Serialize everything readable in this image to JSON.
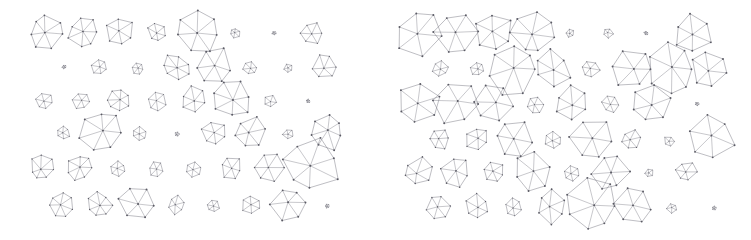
{
  "figure": {
    "width": 751,
    "height": 240,
    "background": "#ffffff",
    "stroke_color": "#6e6e78",
    "node_color": "#5a5a64",
    "glyph_type": "wheel-graph"
  },
  "chart_data": {
    "type": "scatter",
    "title": "",
    "subtitle": "",
    "xlabel": "",
    "ylabel": "",
    "grid": false,
    "legend": null,
    "axis_ticks": [],
    "marker": "wheel-graph",
    "xlim": [
      0,
      751
    ],
    "ylim": [
      0,
      240
    ],
    "panels": [
      {
        "name": "left-panel",
        "x_range": [
          20,
          345
        ],
        "y_range": [
          10,
          230
        ],
        "points": [
          {
            "x": 46,
            "y": 32,
            "size": 16,
            "sides": 7,
            "rot": 14
          },
          {
            "x": 84,
            "y": 32,
            "size": 15,
            "sides": 7,
            "rot": 52
          },
          {
            "x": 120,
            "y": 32,
            "size": 14,
            "sides": 6,
            "rot": 23
          },
          {
            "x": 157,
            "y": 32,
            "size": 10,
            "sides": 6,
            "rot": 77
          },
          {
            "x": 198,
            "y": 31,
            "size": 21,
            "sides": 7,
            "rot": 9
          },
          {
            "x": 235,
            "y": 33,
            "size": 5,
            "sides": 6,
            "rot": 40
          },
          {
            "x": 274,
            "y": 33,
            "size": 2,
            "sides": 5,
            "rot": 15
          },
          {
            "x": 312,
            "y": 33,
            "size": 11,
            "sides": 6,
            "rot": 63
          },
          {
            "x": 64,
            "y": 67,
            "size": 2,
            "sides": 5,
            "rot": 30
          },
          {
            "x": 100,
            "y": 67,
            "size": 8,
            "sides": 6,
            "rot": 18
          },
          {
            "x": 138,
            "y": 68,
            "size": 6,
            "sides": 6,
            "rot": 70
          },
          {
            "x": 176,
            "y": 67,
            "size": 13,
            "sides": 7,
            "rot": 34
          },
          {
            "x": 214,
            "y": 67,
            "size": 19,
            "sides": 6,
            "rot": 5
          },
          {
            "x": 250,
            "y": 68,
            "size": 7,
            "sides": 6,
            "rot": 48
          },
          {
            "x": 288,
            "y": 68,
            "size": 4,
            "sides": 5,
            "rot": 27
          },
          {
            "x": 325,
            "y": 67,
            "size": 12,
            "sides": 6,
            "rot": 59
          },
          {
            "x": 44,
            "y": 101,
            "size": 8,
            "sides": 6,
            "rot": 12
          },
          {
            "x": 81,
            "y": 101,
            "size": 8,
            "sides": 6,
            "rot": 66
          },
          {
            "x": 119,
            "y": 100,
            "size": 11,
            "sides": 7,
            "rot": 31
          },
          {
            "x": 157,
            "y": 101,
            "size": 9,
            "sides": 6,
            "rot": 80
          },
          {
            "x": 194,
            "y": 100,
            "size": 13,
            "sides": 6,
            "rot": 20
          },
          {
            "x": 232,
            "y": 99,
            "size": 18,
            "sides": 7,
            "rot": 44
          },
          {
            "x": 270,
            "y": 101,
            "size": 7,
            "sides": 5,
            "rot": 8
          },
          {
            "x": 308,
            "y": 101,
            "size": 2,
            "sides": 5,
            "rot": 55
          },
          {
            "x": 63,
            "y": 133,
            "size": 7,
            "sides": 6,
            "rot": 25
          },
          {
            "x": 101,
            "y": 132,
            "size": 20,
            "sides": 7,
            "rot": 61
          },
          {
            "x": 139,
            "y": 134,
            "size": 7,
            "sides": 6,
            "rot": 37
          },
          {
            "x": 177,
            "y": 134,
            "size": 2,
            "sides": 5,
            "rot": 72
          },
          {
            "x": 214,
            "y": 133,
            "size": 12,
            "sides": 6,
            "rot": 16
          },
          {
            "x": 250,
            "y": 133,
            "size": 16,
            "sides": 6,
            "rot": 50
          },
          {
            "x": 288,
            "y": 134,
            "size": 5,
            "sides": 5,
            "rot": 29
          },
          {
            "x": 326,
            "y": 132,
            "size": 18,
            "sides": 7,
            "rot": 68
          },
          {
            "x": 42,
            "y": 168,
            "size": 12,
            "sides": 7,
            "rot": 10
          },
          {
            "x": 80,
            "y": 168,
            "size": 12,
            "sides": 7,
            "rot": 57
          },
          {
            "x": 118,
            "y": 169,
            "size": 8,
            "sides": 6,
            "rot": 22
          },
          {
            "x": 156,
            "y": 169,
            "size": 7,
            "sides": 6,
            "rot": 75
          },
          {
            "x": 193,
            "y": 169,
            "size": 8,
            "sides": 6,
            "rot": 41
          },
          {
            "x": 231,
            "y": 168,
            "size": 11,
            "sides": 6,
            "rot": 13
          },
          {
            "x": 269,
            "y": 168,
            "size": 14,
            "sides": 6,
            "rot": 64
          },
          {
            "x": 311,
            "y": 166,
            "size": 27,
            "sides": 7,
            "rot": 35
          },
          {
            "x": 61,
            "y": 205,
            "size": 12,
            "sides": 7,
            "rot": 19
          },
          {
            "x": 99,
            "y": 205,
            "size": 12,
            "sides": 7,
            "rot": 53
          },
          {
            "x": 138,
            "y": 204,
            "size": 18,
            "sides": 6,
            "rot": 7
          },
          {
            "x": 176,
            "y": 205,
            "size": 9,
            "sides": 6,
            "rot": 46
          },
          {
            "x": 213,
            "y": 206,
            "size": 6,
            "sides": 6,
            "rot": 78
          },
          {
            "x": 251,
            "y": 205,
            "size": 9,
            "sides": 6,
            "rot": 26
          },
          {
            "x": 289,
            "y": 204,
            "size": 17,
            "sides": 6,
            "rot": 60
          },
          {
            "x": 327,
            "y": 206,
            "size": 2,
            "sides": 5,
            "rot": 33
          }
        ]
      },
      {
        "name": "right-panel",
        "x_range": [
          395,
          745
        ],
        "y_range": [
          10,
          230
        ],
        "points": [
          {
            "x": 419,
            "y": 33,
            "size": 22,
            "sides": 6,
            "rot": 15
          },
          {
            "x": 457,
            "y": 33,
            "size": 21,
            "sides": 6,
            "rot": 58
          },
          {
            "x": 494,
            "y": 33,
            "size": 19,
            "sides": 6,
            "rot": 24
          },
          {
            "x": 533,
            "y": 32,
            "size": 23,
            "sides": 7,
            "rot": 69
          },
          {
            "x": 570,
            "y": 33,
            "size": 4,
            "sides": 5,
            "rot": 38
          },
          {
            "x": 608,
            "y": 33,
            "size": 5,
            "sides": 5,
            "rot": 11
          },
          {
            "x": 646,
            "y": 33,
            "size": 2,
            "sides": 5,
            "rot": 50
          },
          {
            "x": 693,
            "y": 33,
            "size": 19,
            "sides": 6,
            "rot": 28
          },
          {
            "x": 440,
            "y": 69,
            "size": 8,
            "sides": 6,
            "rot": 43
          },
          {
            "x": 478,
            "y": 69,
            "size": 7,
            "sides": 6,
            "rot": 17
          },
          {
            "x": 513,
            "y": 68,
            "size": 26,
            "sides": 7,
            "rot": 62
          },
          {
            "x": 552,
            "y": 69,
            "size": 18,
            "sides": 6,
            "rot": 31
          },
          {
            "x": 590,
            "y": 69,
            "size": 9,
            "sides": 6,
            "rot": 74
          },
          {
            "x": 632,
            "y": 68,
            "size": 21,
            "sides": 6,
            "rot": 6
          },
          {
            "x": 672,
            "y": 68,
            "size": 24,
            "sides": 7,
            "rot": 47
          },
          {
            "x": 710,
            "y": 69,
            "size": 18,
            "sides": 6,
            "rot": 21
          },
          {
            "x": 418,
            "y": 103,
            "size": 20,
            "sides": 6,
            "rot": 36
          },
          {
            "x": 456,
            "y": 103,
            "size": 21,
            "sides": 6,
            "rot": 65
          },
          {
            "x": 494,
            "y": 103,
            "size": 19,
            "sides": 6,
            "rot": 9
          },
          {
            "x": 535,
            "y": 105,
            "size": 8,
            "sides": 6,
            "rot": 54
          },
          {
            "x": 572,
            "y": 104,
            "size": 17,
            "sides": 6,
            "rot": 27
          },
          {
            "x": 610,
            "y": 104,
            "size": 8,
            "sides": 6,
            "rot": 71
          },
          {
            "x": 650,
            "y": 103,
            "size": 21,
            "sides": 6,
            "rot": 42
          },
          {
            "x": 697,
            "y": 104,
            "size": 2,
            "sides": 5,
            "rot": 14
          },
          {
            "x": 439,
            "y": 139,
            "size": 11,
            "sides": 6,
            "rot": 56
          },
          {
            "x": 477,
            "y": 139,
            "size": 11,
            "sides": 6,
            "rot": 23
          },
          {
            "x": 513,
            "y": 139,
            "size": 19,
            "sides": 6,
            "rot": 67
          },
          {
            "x": 553,
            "y": 140,
            "size": 8,
            "sides": 6,
            "rot": 32
          },
          {
            "x": 592,
            "y": 139,
            "size": 21,
            "sides": 6,
            "rot": 4
          },
          {
            "x": 631,
            "y": 140,
            "size": 10,
            "sides": 6,
            "rot": 49
          },
          {
            "x": 669,
            "y": 141,
            "size": 5,
            "sides": 5,
            "rot": 76
          },
          {
            "x": 709,
            "y": 138,
            "size": 24,
            "sides": 6,
            "rot": 18
          },
          {
            "x": 418,
            "y": 172,
            "size": 14,
            "sides": 6,
            "rot": 40
          },
          {
            "x": 456,
            "y": 172,
            "size": 14,
            "sides": 6,
            "rot": 12
          },
          {
            "x": 494,
            "y": 172,
            "size": 11,
            "sides": 6,
            "rot": 73
          },
          {
            "x": 532,
            "y": 171,
            "size": 18,
            "sides": 6,
            "rot": 45
          },
          {
            "x": 571,
            "y": 173,
            "size": 8,
            "sides": 6,
            "rot": 20
          },
          {
            "x": 610,
            "y": 172,
            "size": 18,
            "sides": 6,
            "rot": 60
          },
          {
            "x": 649,
            "y": 173,
            "size": 4,
            "sides": 5,
            "rot": 34
          },
          {
            "x": 686,
            "y": 172,
            "size": 10,
            "sides": 6,
            "rot": 8
          },
          {
            "x": 438,
            "y": 207,
            "size": 12,
            "sides": 6,
            "rot": 51
          },
          {
            "x": 477,
            "y": 207,
            "size": 12,
            "sides": 6,
            "rot": 25
          },
          {
            "x": 513,
            "y": 208,
            "size": 9,
            "sides": 6,
            "rot": 79
          },
          {
            "x": 551,
            "y": 207,
            "size": 16,
            "sides": 6,
            "rot": 37
          },
          {
            "x": 592,
            "y": 205,
            "size": 25,
            "sides": 7,
            "rot": 3
          },
          {
            "x": 633,
            "y": 206,
            "size": 18,
            "sides": 6,
            "rot": 66
          },
          {
            "x": 672,
            "y": 208,
            "size": 5,
            "sides": 5,
            "rot": 30
          },
          {
            "x": 714,
            "y": 208,
            "size": 2,
            "sides": 5,
            "rot": 59
          }
        ]
      }
    ]
  }
}
